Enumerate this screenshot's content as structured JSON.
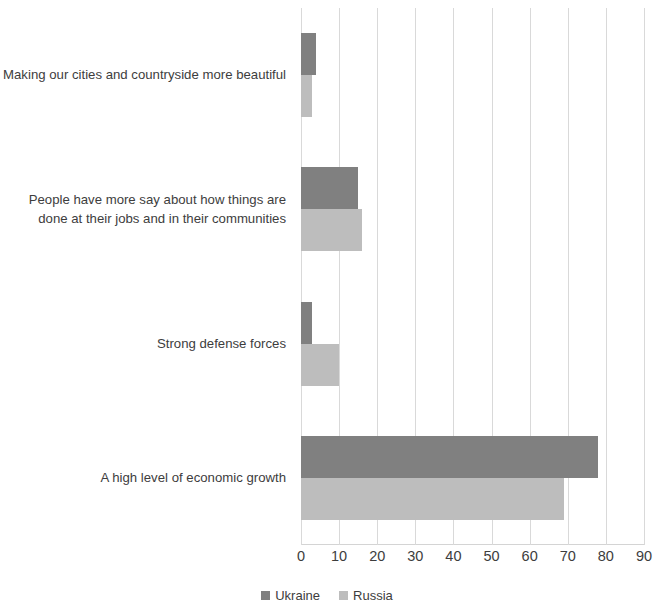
{
  "chart_data": {
    "type": "bar",
    "orientation": "horizontal",
    "title": "",
    "subtitle": "",
    "xlabel": "",
    "ylabel": "",
    "xlim": [
      0,
      90
    ],
    "xticks": [
      "0",
      "10",
      "20",
      "30",
      "40",
      "50",
      "60",
      "70",
      "80",
      "90"
    ],
    "grid": true,
    "legend_position": "bottom-center",
    "categories": [
      "Making our cities and countryside more beautiful",
      "People have more say about how things are done at their jobs and in their communities",
      "Strong defense forces",
      "A high level of economic growth"
    ],
    "series": [
      {
        "name": "Ukraine",
        "color": "#808080",
        "values": [
          4,
          15,
          3,
          78
        ]
      },
      {
        "name": "Russia",
        "color": "#bdbdbd",
        "values": [
          3,
          16,
          10,
          69
        ]
      }
    ]
  },
  "legend": {
    "items": [
      {
        "label": "Ukraine",
        "color": "#808080"
      },
      {
        "label": "Russia",
        "color": "#bdbdbd"
      }
    ]
  },
  "axis": {
    "x_tick_labels": [
      "0",
      "10",
      "20",
      "30",
      "40",
      "50",
      "60",
      "70",
      "80",
      "90"
    ]
  },
  "category_labels": [
    "Making our cities and countryside more beautiful",
    "People have more say about how things are done at their jobs and in their communities",
    "Strong defense forces",
    "A high level of economic growth"
  ]
}
